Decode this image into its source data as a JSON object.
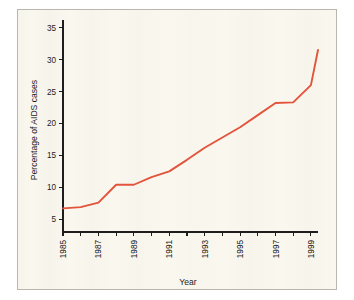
{
  "figure": {
    "background_color": "#ffffff",
    "card_background_color": "#faf7ef",
    "card_border_color": "#b9b6ad"
  },
  "chart_data": {
    "type": "line",
    "title": "",
    "subtitle": "",
    "xlabel": "Year",
    "ylabel": "Percentage of AIDS cases",
    "xlim": [
      1985,
      1999.4
    ],
    "ylim": [
      3.0,
      36.2
    ],
    "grid": false,
    "legend": null,
    "legend_position": "none",
    "line_color": "#e2543b",
    "line_width": 1.9,
    "x_tick_labels": [
      "1985",
      "1987",
      "1989",
      "1991",
      "1993",
      "1995",
      "1997",
      "1999"
    ],
    "x_tick_values": [
      1985,
      1987,
      1989,
      1991,
      1993,
      1995,
      1997,
      1999
    ],
    "x_minor_tick_values": [
      1986,
      1988,
      1990,
      1992,
      1994,
      1996,
      1998
    ],
    "x_tick_label_rotation": -90,
    "y_tick_labels": [
      "5",
      "10",
      "15",
      "20",
      "25",
      "30",
      "35"
    ],
    "y_tick_values": [
      5,
      10,
      15,
      20,
      25,
      30,
      35
    ],
    "series": [
      {
        "name": "Percentage of AIDS cases",
        "color": "#e2543b",
        "x": [
          1985,
          1986,
          1987,
          1988,
          1989,
          1990,
          1991,
          1992,
          1993,
          1994,
          1995,
          1996,
          1997,
          1998,
          1999,
          1999.4
        ],
        "values": [
          6.7,
          6.9,
          7.6,
          10.4,
          10.4,
          11.6,
          12.5,
          14.3,
          16.2,
          17.8,
          19.4,
          21.3,
          23.2,
          23.3,
          26.0,
          31.5
        ]
      }
    ],
    "annotations": []
  },
  "axes": {
    "y_axis_label": "Percentage of AIDS cases",
    "x_axis_label": "Year"
  }
}
